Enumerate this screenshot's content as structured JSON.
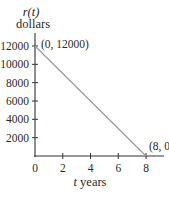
{
  "chart_data": {
    "type": "line",
    "title": "",
    "ylabel_line1": "r(t)",
    "ylabel_line2": "dollars",
    "xlabel": "t years",
    "xlim": [
      0,
      9.3
    ],
    "ylim": [
      0,
      13200
    ],
    "x_ticks": [
      0,
      2,
      4,
      6,
      8
    ],
    "x_tick_labels": [
      "0",
      "2",
      "4",
      "6",
      "8"
    ],
    "y_ticks": [
      2000,
      4000,
      6000,
      8000,
      10000,
      12000
    ],
    "y_tick_labels": [
      "2000",
      "4000",
      "6000",
      "8000",
      "10000",
      "12000"
    ],
    "grid": false,
    "series": [
      {
        "name": "r(t)",
        "x": [
          0,
          8
        ],
        "y": [
          12000,
          0
        ],
        "color": "#9a9a9a"
      }
    ],
    "annotations": [
      {
        "text": "(0, 12000)",
        "x": 0,
        "y": 12000
      },
      {
        "text": "(8, 0)",
        "x": 8,
        "y": 0
      }
    ],
    "axis_color": "#333333"
  }
}
